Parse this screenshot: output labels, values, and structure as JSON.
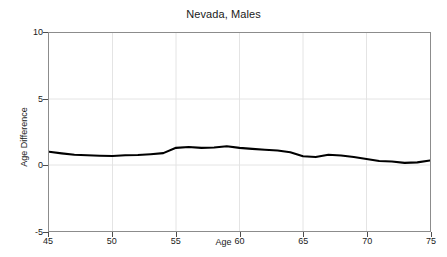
{
  "chart_data": {
    "type": "line",
    "title": "Nevada, Males",
    "xlabel": "Age",
    "ylabel": "Age Difference",
    "xlim": [
      45,
      75
    ],
    "ylim": [
      -5,
      10
    ],
    "grid": true,
    "legend": null,
    "xticks": [
      45,
      50,
      55,
      60,
      65,
      70,
      75
    ],
    "yticks": [
      -5,
      0,
      5,
      10
    ],
    "xtick_labels": [
      "45",
      "50",
      "55",
      "60",
      "65",
      "70",
      "75"
    ],
    "ytick_labels": [
      "-5",
      "0",
      "5",
      "10"
    ],
    "series": [
      {
        "name": "Age Difference",
        "color": "#000000",
        "x": [
          45,
          46,
          47,
          48,
          49,
          50,
          51,
          52,
          53,
          54,
          55,
          56,
          57,
          58,
          59,
          60,
          61,
          62,
          63,
          64,
          65,
          66,
          67,
          68,
          69,
          70,
          71,
          72,
          73,
          74,
          75
        ],
        "values": [
          1.0,
          0.88,
          0.78,
          0.74,
          0.7,
          0.68,
          0.74,
          0.76,
          0.82,
          0.9,
          1.3,
          1.36,
          1.3,
          1.32,
          1.42,
          1.3,
          1.22,
          1.16,
          1.1,
          0.96,
          0.66,
          0.6,
          0.78,
          0.72,
          0.6,
          0.46,
          0.3,
          0.26,
          0.16,
          0.2,
          0.34
        ]
      }
    ]
  },
  "figure": {
    "background": "#ffffff",
    "axes_color": "#8c8c8c",
    "grid_color": "#e2e2e2",
    "text_color": "#1a1a1a"
  }
}
